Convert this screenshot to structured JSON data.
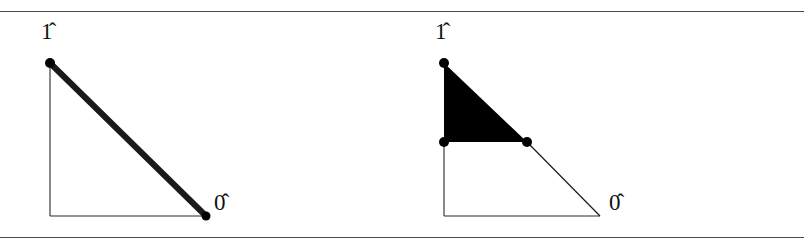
{
  "figure": {
    "background_color": "#ffffff",
    "ink_color": "#111111",
    "rule_color": "#4a4a4a",
    "width": 804,
    "height": 248,
    "rules": [
      {
        "name": "top-rule",
        "y": 11
      },
      {
        "name": "bottom-rule",
        "y": 237
      }
    ],
    "panels": [
      {
        "id": "left",
        "name": "chain-simplex-diagram",
        "origin": {
          "x": 50,
          "y": 204
        },
        "axes": {
          "vertical": {
            "x1": 50,
            "y1": 51,
            "x2": 50,
            "y2": 204
          },
          "horizontal": {
            "x1": 50,
            "y1": 204,
            "x2": 206,
            "y2": 204
          },
          "stroke_width": 1.1
        },
        "edges": [
          {
            "name": "thick-hypotenuse",
            "x1": 50,
            "y1": 51,
            "x2": 206,
            "y2": 204,
            "stroke_width": 6,
            "color": "#1a1a1a",
            "style": "thick"
          }
        ],
        "filled_regions": [],
        "vertices": [
          {
            "name": "top-vertex",
            "x": 50,
            "y": 51,
            "r": 5.0
          },
          {
            "name": "bottom-right-vertex",
            "x": 206,
            "y": 204,
            "r": 4.5
          }
        ],
        "labels": [
          {
            "name": "label-one",
            "text": "1̂",
            "anchor": "top-vertex",
            "position": "above"
          },
          {
            "name": "label-zero",
            "text": "0̂",
            "anchor": "bottom-right-vertex",
            "position": "right"
          }
        ]
      },
      {
        "id": "right",
        "name": "filled-simplex-diagram",
        "origin": {
          "x": 42,
          "y": 204
        },
        "axes": {
          "vertical": {
            "x1": 42,
            "y1": 130,
            "x2": 42,
            "y2": 204
          },
          "horizontal": {
            "x1": 42,
            "y1": 204,
            "x2": 198,
            "y2": 204
          },
          "stroke_width": 1.1
        },
        "edges": [
          {
            "name": "thin-hypotenuse",
            "x1": 125,
            "y1": 130,
            "x2": 198,
            "y2": 204,
            "stroke_width": 1.1,
            "color": "#1a1a1a",
            "style": "thin"
          }
        ],
        "filled_regions": [
          {
            "name": "solid-triangle",
            "points": "42,51 42,130 125,130",
            "fill": "#000000"
          }
        ],
        "vertices": [
          {
            "name": "top-vertex",
            "x": 42,
            "y": 51,
            "r": 5.0
          },
          {
            "name": "mid-left-vertex",
            "x": 42,
            "y": 130,
            "r": 5.0
          },
          {
            "name": "mid-right-vertex",
            "x": 125,
            "y": 130,
            "r": 5.0
          }
        ],
        "labels": [
          {
            "name": "label-one",
            "text": "1̂",
            "anchor": "top-vertex",
            "position": "above"
          },
          {
            "name": "label-zero",
            "text": "0̂",
            "anchor": "axis-endpoint",
            "position": "right"
          }
        ]
      }
    ],
    "label_text": {
      "one": "1̂",
      "zero": "0̂"
    }
  }
}
